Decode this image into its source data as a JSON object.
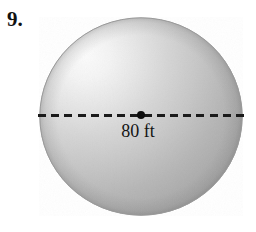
{
  "figure": {
    "problem_number": "9.",
    "shape": "sphere",
    "diameter_label": "80 ft",
    "center_point_name": "center-point",
    "bottom_clipped_text": "",
    "colors": {
      "background": "#ffffff",
      "text": "#141414",
      "number_text": "#111111",
      "line": "#1a1a1a",
      "center_dot": "#0d0d0d",
      "sphere_highlight": "#f7f7f7",
      "sphere_midtone": "#c9c9c9",
      "sphere_shadow": "#a0a0a0",
      "sphere_edge": "#9a9a9a"
    },
    "geometry": {
      "circle_center_x": 141,
      "circle_center_y": 116,
      "circle_radius": 102,
      "highlight_x": 85,
      "highlight_y": 56,
      "diameter_line_y": 115,
      "dash_length": 8,
      "dash_gap": 5
    }
  }
}
